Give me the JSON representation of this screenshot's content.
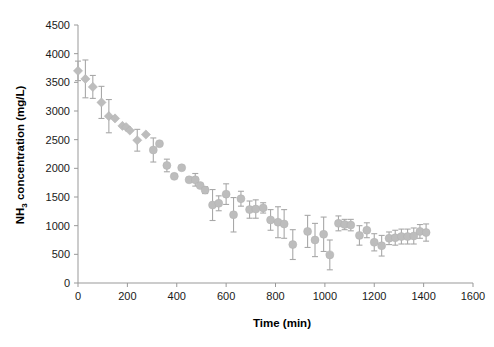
{
  "chart_data": {
    "type": "scatter",
    "title": "",
    "xlabel": "Time (min)",
    "ylabel_parts": {
      "pre": "NH",
      "sub": "3",
      "post": " concentration (mg/L)"
    },
    "ylabel": "NH3 concentration (mg/L)",
    "xlim": [
      0,
      1600
    ],
    "ylim": [
      0,
      4500
    ],
    "xticks": [
      0,
      200,
      400,
      600,
      800,
      1000,
      1200,
      1400,
      1600
    ],
    "yticks": [
      0,
      500,
      1000,
      1500,
      2000,
      2500,
      3000,
      3500,
      4000,
      4500
    ],
    "grid": false,
    "legend": "none",
    "marker_color": "#bdbdbd",
    "errorbar_color": "#a8a8a8",
    "axis_color": "#999999",
    "series": [
      {
        "name": "NH3 concentration",
        "marker_shapes": "diamond for t<=300, circle for t>300",
        "points": [
          {
            "x": 0,
            "y": 3700,
            "err": 170,
            "marker": "diamond"
          },
          {
            "x": 30,
            "y": 3560,
            "err": 330,
            "marker": "diamond"
          },
          {
            "x": 60,
            "y": 3420,
            "err": 200,
            "marker": "diamond"
          },
          {
            "x": 95,
            "y": 3150,
            "err": 280,
            "marker": "diamond"
          },
          {
            "x": 125,
            "y": 2910,
            "err": 290,
            "marker": "diamond"
          },
          {
            "x": 150,
            "y": 2870,
            "err": 0,
            "marker": "diamond"
          },
          {
            "x": 180,
            "y": 2740,
            "err": 0,
            "marker": "diamond"
          },
          {
            "x": 195,
            "y": 2720,
            "err": 0,
            "marker": "diamond"
          },
          {
            "x": 210,
            "y": 2660,
            "err": 0,
            "marker": "diamond"
          },
          {
            "x": 240,
            "y": 2490,
            "err": 190,
            "marker": "diamond"
          },
          {
            "x": 275,
            "y": 2590,
            "err": 0,
            "marker": "diamond"
          },
          {
            "x": 305,
            "y": 2320,
            "err": 210,
            "marker": "circle"
          },
          {
            "x": 330,
            "y": 2430,
            "err": 0,
            "marker": "circle"
          },
          {
            "x": 360,
            "y": 2050,
            "err": 110,
            "marker": "circle"
          },
          {
            "x": 390,
            "y": 1860,
            "err": 0,
            "marker": "circle"
          },
          {
            "x": 420,
            "y": 2010,
            "err": 0,
            "marker": "circle"
          },
          {
            "x": 450,
            "y": 1800,
            "err": 0,
            "marker": "circle"
          },
          {
            "x": 475,
            "y": 1800,
            "err": 110,
            "marker": "circle"
          },
          {
            "x": 495,
            "y": 1700,
            "err": 0,
            "marker": "circle"
          },
          {
            "x": 515,
            "y": 1620,
            "err": 60,
            "marker": "circle"
          },
          {
            "x": 545,
            "y": 1360,
            "err": 270,
            "marker": "circle"
          },
          {
            "x": 570,
            "y": 1390,
            "err": 130,
            "marker": "circle"
          },
          {
            "x": 600,
            "y": 1550,
            "err": 180,
            "marker": "circle"
          },
          {
            "x": 630,
            "y": 1190,
            "err": 300,
            "marker": "circle"
          },
          {
            "x": 660,
            "y": 1470,
            "err": 130,
            "marker": "circle"
          },
          {
            "x": 695,
            "y": 1280,
            "err": 150,
            "marker": "circle"
          },
          {
            "x": 720,
            "y": 1290,
            "err": 160,
            "marker": "circle"
          },
          {
            "x": 750,
            "y": 1310,
            "err": 90,
            "marker": "circle"
          },
          {
            "x": 780,
            "y": 1100,
            "err": 180,
            "marker": "circle"
          },
          {
            "x": 810,
            "y": 1060,
            "err": 270,
            "marker": "circle"
          },
          {
            "x": 835,
            "y": 1030,
            "err": 250,
            "marker": "circle"
          },
          {
            "x": 870,
            "y": 670,
            "err": 260,
            "marker": "circle"
          },
          {
            "x": 930,
            "y": 900,
            "err": 280,
            "marker": "circle"
          },
          {
            "x": 960,
            "y": 750,
            "err": 290,
            "marker": "circle"
          },
          {
            "x": 995,
            "y": 850,
            "err": 300,
            "marker": "circle"
          },
          {
            "x": 1020,
            "y": 490,
            "err": 260,
            "marker": "circle"
          },
          {
            "x": 1055,
            "y": 1040,
            "err": 130,
            "marker": "circle"
          },
          {
            "x": 1080,
            "y": 1020,
            "err": 90,
            "marker": "circle"
          },
          {
            "x": 1105,
            "y": 1010,
            "err": 100,
            "marker": "circle"
          },
          {
            "x": 1140,
            "y": 830,
            "err": 170,
            "marker": "circle"
          },
          {
            "x": 1170,
            "y": 920,
            "err": 130,
            "marker": "circle"
          },
          {
            "x": 1200,
            "y": 710,
            "err": 150,
            "marker": "circle"
          },
          {
            "x": 1230,
            "y": 650,
            "err": 180,
            "marker": "circle"
          },
          {
            "x": 1260,
            "y": 780,
            "err": 110,
            "marker": "circle"
          },
          {
            "x": 1285,
            "y": 790,
            "err": 130,
            "marker": "circle"
          },
          {
            "x": 1310,
            "y": 810,
            "err": 130,
            "marker": "circle"
          },
          {
            "x": 1335,
            "y": 810,
            "err": 130,
            "marker": "circle"
          },
          {
            "x": 1360,
            "y": 820,
            "err": 140,
            "marker": "circle"
          },
          {
            "x": 1385,
            "y": 900,
            "err": 120,
            "marker": "circle"
          },
          {
            "x": 1410,
            "y": 880,
            "err": 150,
            "marker": "circle"
          }
        ]
      }
    ]
  }
}
